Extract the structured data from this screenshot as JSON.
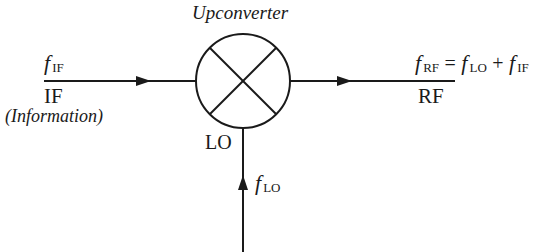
{
  "title": "Upconverter",
  "input": {
    "symbol": "f",
    "subscript": "IF",
    "label": "IF",
    "description": "(Information)"
  },
  "output": {
    "lhs_symbol": "f",
    "lhs_subscript": "RF",
    "equals": "=",
    "term1_symbol": "f",
    "term1_subscript": "LO",
    "plus": "+",
    "term2_symbol": "f",
    "term2_subscript": "IF",
    "label": "RF"
  },
  "lo": {
    "label": "LO",
    "symbol": "f",
    "subscript": "LO"
  },
  "colors": {
    "stroke": "#1a1a1a",
    "background": "#ffffff"
  }
}
